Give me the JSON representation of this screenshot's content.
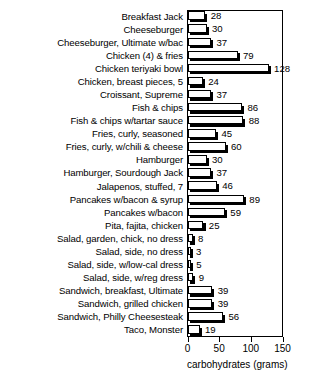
{
  "chart_data": {
    "type": "bar",
    "orientation": "horizontal",
    "title": "",
    "xlabel": "carbohydrates (grams)",
    "ylabel": "",
    "xlim": [
      0,
      150
    ],
    "xticks": [
      0,
      50,
      100,
      150
    ],
    "grid": false,
    "legend": null,
    "categories": [
      "Breakfast Jack",
      "Cheeseburger",
      "Cheeseburger, Ultimate w/bac",
      "Chicken (4) & fries",
      "Chicken teriyaki bowl",
      "Chicken, breast pieces, 5",
      "Croissant, Supreme",
      "Fish & chips",
      "Fish & chips w/tartar sauce",
      "Fries, curly, seasoned",
      "Fries, curly, w/chili & cheese",
      "Hamburger",
      "Hamburger, Sourdough Jack",
      "Jalapenos, stuffed, 7",
      "Pancakes w/bacon & syrup",
      "Pancakes w/bacon",
      "Pita, fajita, chicken",
      "Salad, garden, chick, no dress",
      "Salad, side, no dress",
      "Salad, side, w/low-cal dress",
      "Salad, side, w/reg dress",
      "Sandwich, breakfast, Ultimate",
      "Sandwich, grilled chicken",
      "Sandwich, Philly Cheesesteak",
      "Taco, Monster"
    ],
    "values": [
      28,
      30,
      37,
      79,
      128,
      24,
      37,
      86,
      88,
      45,
      60,
      30,
      37,
      46,
      89,
      59,
      25,
      8,
      3,
      5,
      9,
      39,
      39,
      56,
      19
    ]
  },
  "axis": {
    "tick_labels": [
      "0",
      "50",
      "100",
      "150"
    ],
    "title": "carbohydrates (grams)"
  }
}
